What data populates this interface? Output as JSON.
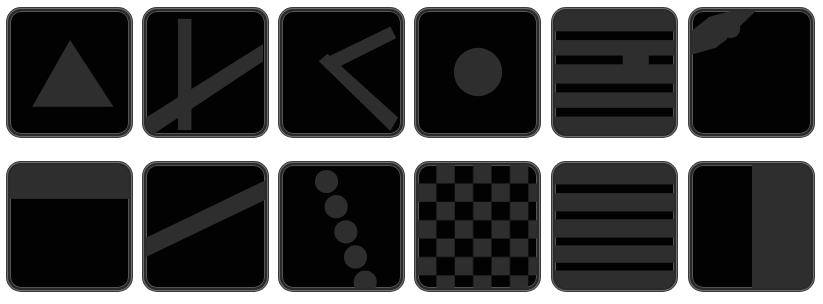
{
  "grid": {
    "rows": 2,
    "cols": 6,
    "tile_fill": "#020202",
    "pattern_color": "#2e2e2e",
    "tiles": [
      {
        "id": 1,
        "pattern": "triangle"
      },
      {
        "id": 2,
        "pattern": "vertical-bar-with-diagonal"
      },
      {
        "id": 3,
        "pattern": "bent-bar-chevron"
      },
      {
        "id": 4,
        "pattern": "circle"
      },
      {
        "id": 5,
        "pattern": "horizontal-stripes-with-notch"
      },
      {
        "id": 6,
        "pattern": "corner-blob"
      },
      {
        "id": 7,
        "pattern": "top-band"
      },
      {
        "id": 8,
        "pattern": "diagonal-bar"
      },
      {
        "id": 9,
        "pattern": "chain-of-circles"
      },
      {
        "id": 10,
        "pattern": "checkerboard"
      },
      {
        "id": 11,
        "pattern": "horizontal-stripes"
      },
      {
        "id": 12,
        "pattern": "right-half-fill"
      }
    ]
  }
}
